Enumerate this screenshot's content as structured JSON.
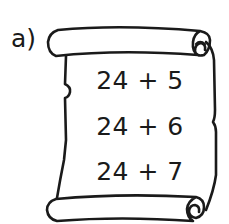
{
  "exercise": {
    "label": "a)",
    "container": "scroll-icon",
    "expressions": [
      {
        "text": "24 + 5",
        "a": 24,
        "op": "+",
        "b": 5
      },
      {
        "text": "24 + 6",
        "a": 24,
        "op": "+",
        "b": 6
      },
      {
        "text": "24 + 7",
        "a": 24,
        "op": "+",
        "b": 7
      }
    ]
  },
  "colors": {
    "ink": "#1a1a1a",
    "background": "#ffffff"
  }
}
